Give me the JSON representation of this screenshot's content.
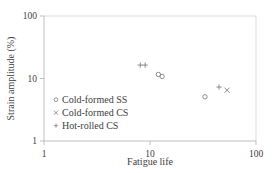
{
  "chart_data": {
    "type": "scatter",
    "title": "",
    "xlabel": "Fatigue life",
    "ylabel": "Strain amplitude (%)",
    "xscale": "log",
    "yscale": "log",
    "xlim": [
      1,
      100
    ],
    "ylim": [
      1,
      100
    ],
    "x_ticks": [
      {
        "value": 1,
        "label": "1"
      },
      {
        "value": 10,
        "label": "10"
      },
      {
        "value": 100,
        "label": "100"
      }
    ],
    "y_ticks": [
      {
        "value": 1,
        "label": "1"
      },
      {
        "value": 10,
        "label": "10"
      },
      {
        "value": 100,
        "label": "100"
      }
    ],
    "grid": false,
    "legend_position": "bottom-left",
    "marker_color": "#7f7f7f",
    "series": [
      {
        "name": "Cold-formed SS",
        "marker": "circle",
        "points": [
          {
            "x": 12.0,
            "y": 11.6
          },
          {
            "x": 13.0,
            "y": 10.8
          },
          {
            "x": 33.0,
            "y": 5.1
          }
        ]
      },
      {
        "name": "Cold-formed CS",
        "marker": "cross",
        "points": [
          {
            "x": 53.3,
            "y": 6.5
          }
        ]
      },
      {
        "name": "Hot-rolled CS",
        "marker": "plus",
        "points": [
          {
            "x": 8.1,
            "y": 16.4
          },
          {
            "x": 9.0,
            "y": 16.4
          },
          {
            "x": 44.8,
            "y": 7.3
          }
        ]
      }
    ]
  }
}
